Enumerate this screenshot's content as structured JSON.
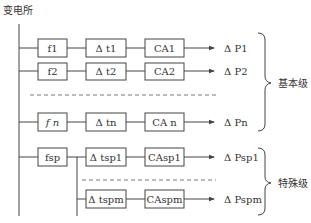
{
  "title": "变电所",
  "basic_level": {
    "label": "基本级",
    "rows": [
      {
        "f": "f1",
        "dt": "Δ t1",
        "ca": "CA1",
        "dp": "Δ P1"
      },
      {
        "f": "f2",
        "dt": "Δ t2",
        "ca": "CA2",
        "dp": "Δ P2"
      },
      {
        "f": "f n",
        "dt": "Δ tn",
        "ca": "CA n",
        "dp": "Δ Pn"
      }
    ]
  },
  "special_level": {
    "label": "特殊级",
    "f": "fsp",
    "rows": [
      {
        "dt": "Δ tsp1",
        "ca": "CAsp1",
        "dp": "Δ Psp1"
      },
      {
        "dt": "Δ tspm",
        "ca": "CAspm",
        "dp": "Δ Pspm"
      }
    ]
  },
  "colors": {
    "line": "#444444",
    "text": "#333333",
    "background": "#ffffff"
  }
}
